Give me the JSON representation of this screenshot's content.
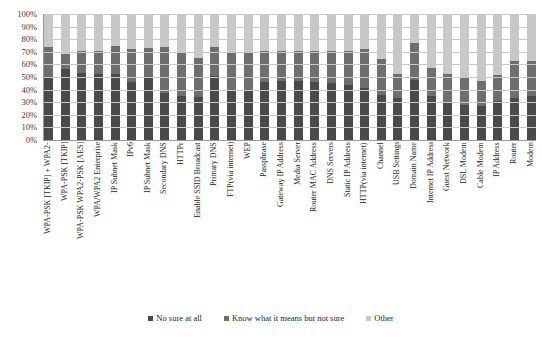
{
  "chart_data": {
    "type": "bar",
    "stacked": true,
    "title": "",
    "subtitle": "",
    "xlabel": "",
    "ylabel": "",
    "ylim": [
      0,
      100
    ],
    "grid": true,
    "legend_position": "bottom",
    "y_ticks": [
      "0%",
      "10%",
      "20%",
      "30%",
      "40%",
      "50%",
      "60%",
      "70%",
      "80%",
      "90%",
      "100%"
    ],
    "categories": [
      "WPA-PSK [TKIP] + WPA2-",
      "WPA-PSK [TKIP]",
      "WPA-PSK WPA2-PSK [AES]",
      "WPA/WPA2 Enterprise",
      "IP Subnet Mask",
      "IPv6",
      "IP Subnet Mask",
      "Secondary DNS",
      "HTTPr",
      "Enable SSID Broadcast",
      "Primary DNS",
      "FTP(via internet)",
      "WEP",
      "Passphrase",
      "Gateway IP Address",
      "Media Server",
      "Router MAC Address",
      "DNS Servers",
      "Static IP Address",
      "HTTP(via internet)",
      "Channel",
      "USB Settings",
      "Domain Name",
      "Internet IP Address",
      "Guest Network",
      "DSL Modem",
      "Cable Modem",
      "IP Address",
      "Router",
      "Modem"
    ],
    "series": [
      {
        "name": "No sure at all",
        "color": "#4a4a4a",
        "values": [
          50,
          56,
          53,
          52,
          52,
          46,
          49,
          37,
          35,
          34,
          51,
          40,
          39,
          46,
          47,
          47,
          46,
          45,
          44,
          41,
          36,
          33,
          48,
          35,
          30,
          28,
          27,
          31,
          33,
          35
        ]
      },
      {
        "name": "Know what it means but not sure",
        "color": "#6e6e6e",
        "values": [
          24,
          12,
          18,
          19,
          23,
          26,
          24,
          37,
          34,
          31,
          23,
          29,
          30,
          25,
          24,
          24,
          25,
          26,
          27,
          31,
          28,
          19,
          29,
          22,
          22,
          22,
          20,
          21,
          30,
          28
        ]
      },
      {
        "name": "Other",
        "color": "#c8c8c8",
        "values": [
          26,
          32,
          29,
          29,
          25,
          28,
          27,
          26,
          31,
          35,
          26,
          31,
          31,
          29,
          29,
          29,
          29,
          29,
          29,
          28,
          36,
          48,
          23,
          43,
          48,
          50,
          53,
          48,
          37,
          37
        ]
      }
    ]
  },
  "legend": {
    "items": [
      {
        "label": "No sure at all",
        "color": "#4a4a4a"
      },
      {
        "label": "Know what it means but not sure",
        "color": "#6e6e6e"
      },
      {
        "label": "Other",
        "color": "#c8c8c8"
      }
    ]
  }
}
